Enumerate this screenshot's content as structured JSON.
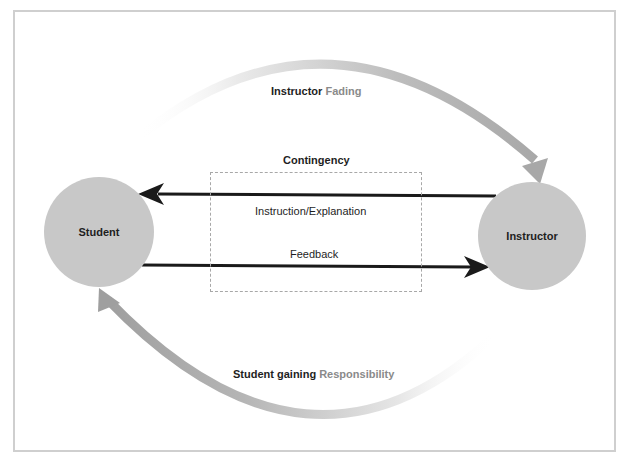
{
  "diagram": {
    "nodes": {
      "student": "Student",
      "instructor": "Instructor"
    },
    "labels": {
      "fading_strong": "Instructor",
      "fading_muted": "Fading",
      "contingency": "Contingency",
      "instruction": "Instruction/Explanation",
      "feedback": "Feedback",
      "responsibility_strong": "Student gaining",
      "responsibility_muted": "Responsibility"
    },
    "edges": [
      {
        "from": "Instructor",
        "to": "Student",
        "label": "Instruction/Explanation",
        "style": "solid-black"
      },
      {
        "from": "Student",
        "to": "Instructor",
        "label": "Feedback",
        "style": "solid-black"
      },
      {
        "from": "Student",
        "to": "Instructor",
        "label": "Instructor Fading",
        "style": "gradient-gray-arc-top"
      },
      {
        "from": "Instructor",
        "to": "Student",
        "label": "Student gaining Responsibility",
        "style": "gradient-gray-arc-bottom"
      }
    ],
    "group": {
      "label": "Contingency",
      "contains": [
        "Instruction/Explanation",
        "Feedback"
      ]
    },
    "colors": {
      "node_fill": "#c8c8c8",
      "arrow_black": "#1a1a1a",
      "arc_gray": "#a6a6a6",
      "muted_text": "#8a8a8a",
      "frame_border": "#cfcfcf"
    }
  }
}
